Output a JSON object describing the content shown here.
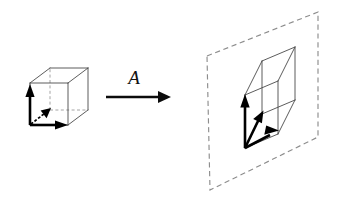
{
  "figure": {
    "background_color": "#ffffff",
    "width": 342,
    "height": 201,
    "stroke_colors": {
      "cube_edge": "#4a4a4a",
      "cube_hidden_edge": "#9a9a9a",
      "plane_border": "#8d8d8d",
      "basis_vector": "#000000",
      "map_arrow": "#0c0c0c",
      "label": "#111111"
    }
  },
  "map_arrow": {
    "label": "A",
    "label_position": {
      "x": 134,
      "y": 84
    },
    "shaft": {
      "x1": 106,
      "y1": 97,
      "x2": 158,
      "y2": 97
    },
    "head_points": "158,91 171,97 158,103",
    "description": "horizontal arrow pointing right, labelled A"
  },
  "source": {
    "name": "unit-cube",
    "description": "wireframe unit cube with three basis vectors at its near-bottom-left corner",
    "origin": {
      "x": 30,
      "y": 125
    },
    "vertices": {
      "front_bottom_left": {
        "x": 30,
        "y": 125
      },
      "front_bottom_right": {
        "x": 68,
        "y": 125
      },
      "front_top_left": {
        "x": 30,
        "y": 83
      },
      "front_top_right": {
        "x": 68,
        "y": 83
      },
      "back_bottom_left": {
        "x": 50,
        "y": 110
      },
      "back_bottom_right": {
        "x": 88,
        "y": 110
      },
      "back_top_left": {
        "x": 50,
        "y": 68
      },
      "back_top_right": {
        "x": 88,
        "y": 68
      }
    },
    "solid_edges": [
      [
        "front_bottom_left",
        "front_bottom_right"
      ],
      [
        "front_bottom_right",
        "front_top_right"
      ],
      [
        "front_top_right",
        "front_top_left"
      ],
      [
        "front_top_left",
        "front_bottom_left"
      ],
      [
        "back_top_left",
        "back_top_right"
      ],
      [
        "back_top_right",
        "back_bottom_right"
      ],
      [
        "front_top_left",
        "back_top_left"
      ],
      [
        "front_top_right",
        "back_top_right"
      ],
      [
        "front_bottom_right",
        "back_bottom_right"
      ]
    ],
    "hidden_edges": [
      [
        "front_bottom_left",
        "back_bottom_left"
      ],
      [
        "back_bottom_left",
        "back_bottom_right"
      ],
      [
        "back_bottom_left",
        "back_top_left"
      ]
    ],
    "basis_vectors": [
      {
        "name": "e2-up",
        "style": "solid",
        "from": {
          "x": 30,
          "y": 125
        },
        "to": {
          "x": 30,
          "y": 92
        },
        "head_points": "30,84 25.4,97 34.6,97"
      },
      {
        "name": "e1-right",
        "style": "solid",
        "from": {
          "x": 30,
          "y": 125
        },
        "to": {
          "x": 59,
          "y": 125
        },
        "head_points": "68,125 55,120.4 55,129.6"
      },
      {
        "name": "e3-depth",
        "style": "dashed",
        "from": {
          "x": 31,
          "y": 124
        },
        "to": {
          "x": 45,
          "y": 113
        },
        "head_points": "51,108 40.6,110.4 46.6,118.3"
      }
    ]
  },
  "target": {
    "name": "collapsed-cube-on-plane",
    "description": "image of the cube under A: a flattened parallelepiped lying inside a dashed plane",
    "origin": {
      "x": 245,
      "y": 148
    },
    "plane": {
      "name": "image-plane",
      "style": "dashed",
      "points": "207,56 318,12 318,137 210,190"
    },
    "vertices": {
      "p0": {
        "x": 245,
        "y": 148
      },
      "p1": {
        "x": 278,
        "y": 134
      },
      "p2": {
        "x": 245,
        "y": 95
      },
      "p3": {
        "x": 278,
        "y": 81
      },
      "p4": {
        "x": 262,
        "y": 114
      },
      "p5": {
        "x": 295,
        "y": 100
      },
      "p6": {
        "x": 262,
        "y": 61
      },
      "p7": {
        "x": 295,
        "y": 47
      }
    },
    "solid_edges": [
      [
        "p0",
        "p1"
      ],
      [
        "p1",
        "p3"
      ],
      [
        "p3",
        "p2"
      ],
      [
        "p2",
        "p0"
      ],
      [
        "p4",
        "p5"
      ],
      [
        "p5",
        "p7"
      ],
      [
        "p7",
        "p6"
      ],
      [
        "p6",
        "p4"
      ],
      [
        "p2",
        "p6"
      ],
      [
        "p3",
        "p7"
      ],
      [
        "p1",
        "p5"
      ],
      [
        "p0",
        "p4"
      ]
    ],
    "hidden_edges": [],
    "basis_vectors": [
      {
        "name": "Ae2-up",
        "style": "solid",
        "from": {
          "x": 245,
          "y": 148
        },
        "to": {
          "x": 245,
          "y": 103
        },
        "head_points": "245,94 240.3,107.5 249.7,107.5"
      },
      {
        "name": "Ae3-diagonal",
        "style": "solid",
        "from": {
          "x": 245,
          "y": 148
        },
        "to": {
          "x": 259,
          "y": 119
        },
        "head_points": "263.5,110.5 253.2,119.0 261.9,123.2"
      },
      {
        "name": "Ae1-right",
        "style": "solid",
        "from": {
          "x": 245,
          "y": 148
        },
        "to": {
          "x": 270,
          "y": 135
        },
        "head_points": "279,130.5 266.2,125.6 264.3,134.7"
      }
    ]
  }
}
